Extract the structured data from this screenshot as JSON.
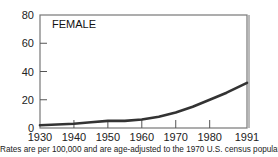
{
  "chart_data": {
    "type": "line",
    "title": "FEMALE",
    "xlabel": "",
    "ylabel": "",
    "x": [
      1930,
      1935,
      1940,
      1945,
      1950,
      1955,
      1960,
      1965,
      1970,
      1975,
      1980,
      1985,
      1991
    ],
    "series": [
      {
        "name": "Female",
        "values": [
          2,
          2.5,
          3,
          4,
          5,
          5,
          6,
          8,
          11,
          15,
          20,
          25,
          32
        ]
      }
    ],
    "x_ticks": [
      "1930",
      "1940",
      "1950",
      "1960",
      "1970",
      "1980",
      "1991"
    ],
    "x_tick_values": [
      1930,
      1940,
      1950,
      1960,
      1970,
      1980,
      1991
    ],
    "y_ticks": [
      "0",
      "20",
      "40",
      "60",
      "80"
    ],
    "y_tick_values": [
      0,
      20,
      40,
      60,
      80
    ],
    "xlim": [
      1930,
      1991
    ],
    "ylim": [
      0,
      80
    ],
    "grid": false,
    "legend": "none",
    "annotations": [
      "FEMALE"
    ]
  },
  "footnote": "Rates are per 100,000 and are age-adjusted to the 1970 U.S. census population."
}
